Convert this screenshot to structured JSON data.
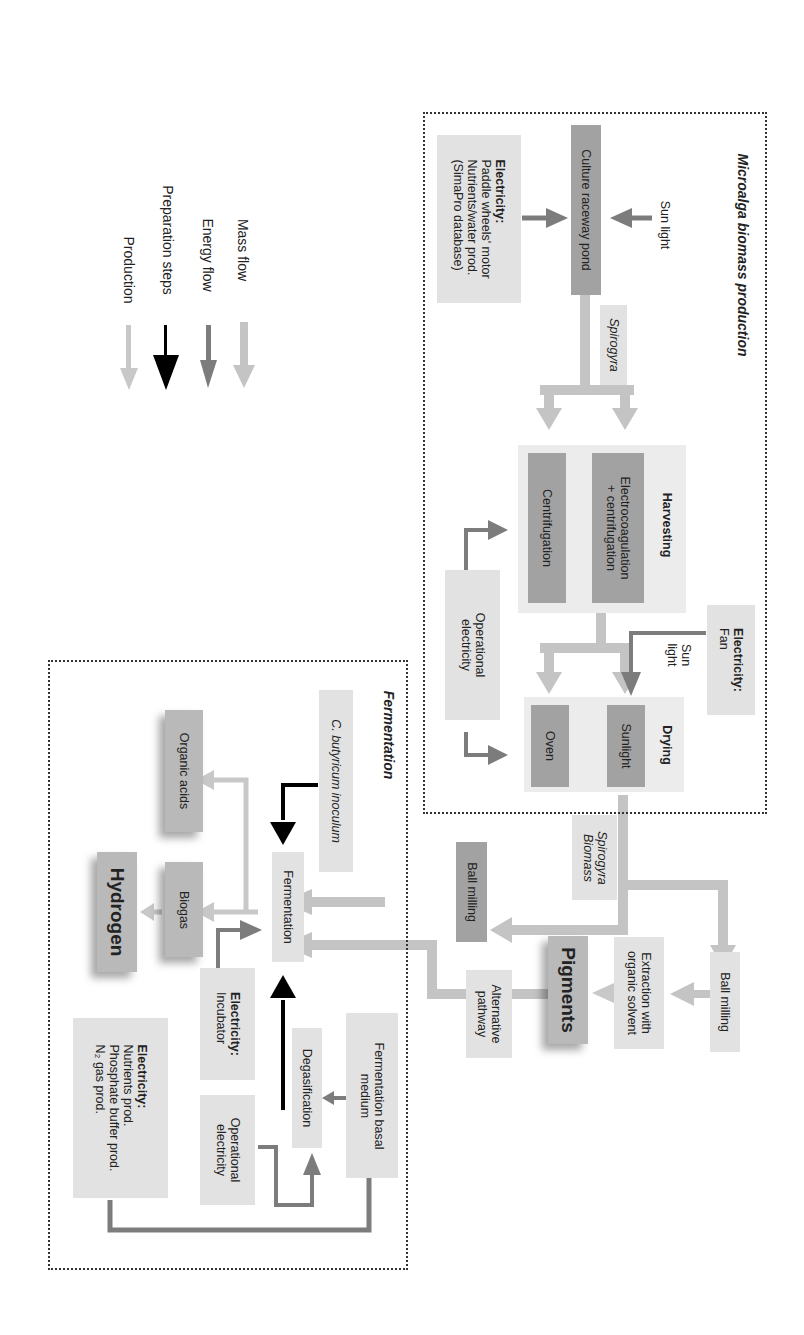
{
  "legend": {
    "items": [
      {
        "label": "Mass flow",
        "color": "#c4c4c4",
        "style": "thick-light"
      },
      {
        "label": "Energy flow",
        "color": "#7c7c7c",
        "style": "medium-dark"
      },
      {
        "label": "Preparation steps",
        "color": "#000000",
        "style": "black"
      },
      {
        "label": "Production",
        "color": "#c8c8c8",
        "style": "thin-light"
      }
    ]
  },
  "microalga": {
    "title": "Microalga biomass production",
    "sun_light": "Sun light",
    "electricity_title": "Electricity:",
    "electricity_lines": "Paddle wheels' motor\nNutrients/water prod.\n(SimaPro database)",
    "pond": "Culture raceway pond",
    "spirogyra": "Spirogyra",
    "harvesting": {
      "title": "Harvesting",
      "option1": "Electrocoagulation\n+ centrifugation",
      "option2": "Centrifugation"
    },
    "operational_electricity": "Operational\nelectricity",
    "electricity_fan_title": "Electricity:",
    "electricity_fan": "Fan",
    "sun_light_drying": "Sun\nlight",
    "drying": {
      "title": "Drying",
      "option1": "Sunlight",
      "option2": "Oven"
    }
  },
  "biomass_label": "Spirogyra\nBiomass",
  "pigments_path": {
    "ball_milling": "Ball milling",
    "extraction": "Extraction with\norganic solvent",
    "pigments": "Pigments",
    "alternative": "Alternative\npathway"
  },
  "ball_milling_fermentation": "Ball milling",
  "fermentation": {
    "title": "Fermentation",
    "inoculum": "C. butyricum inoculum",
    "process": "Fermentation",
    "organic_acids": "Organic acids",
    "biogas": "Biogas",
    "hydrogen": "Hydrogen",
    "electricity_incubator_title": "Electricity:",
    "electricity_incubator": "Incubator",
    "degasification": "Degasification",
    "basal_medium": "Fermentation basal\nmedium",
    "operational_electricity": "Operational\nelectricity",
    "electricity_prod_title": "Electricity:",
    "electricity_prod_lines": "Nutrients prod.\nPhosphate buffer prod.\nN₂ gas prod."
  }
}
